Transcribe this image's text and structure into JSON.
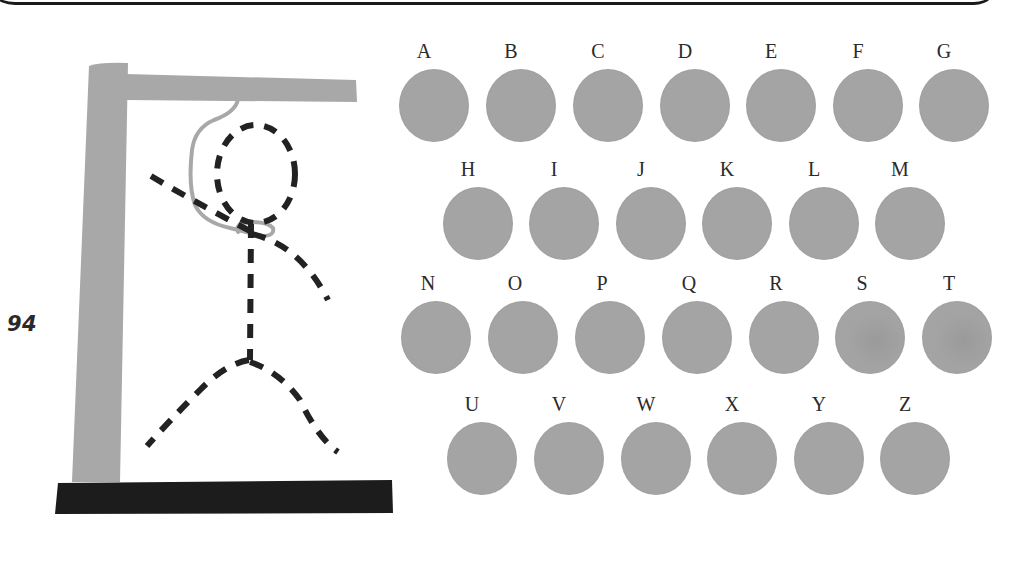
{
  "page": {
    "number": "94"
  },
  "game": {
    "type": "hangman",
    "colors": {
      "gallows_post": "#a8a8a8",
      "base": "#1c1c1c",
      "rope": "#a8a8a8",
      "figure_dashes": "#222222",
      "letter_circle": "#a4a4a4",
      "letter_text": "#2b2b2b"
    },
    "figure": {
      "style": "dashed",
      "parts": [
        "head",
        "body",
        "left-arm",
        "right-arm",
        "left-leg",
        "right-leg"
      ]
    },
    "letters": {
      "row1": [
        {
          "label": "A"
        },
        {
          "label": "B"
        },
        {
          "label": "C"
        },
        {
          "label": "D"
        },
        {
          "label": "E"
        },
        {
          "label": "F"
        },
        {
          "label": "G"
        }
      ],
      "row2": [
        {
          "label": "H"
        },
        {
          "label": "I"
        },
        {
          "label": "J"
        },
        {
          "label": "K"
        },
        {
          "label": "L"
        },
        {
          "label": "M"
        }
      ],
      "row3": [
        {
          "label": "N"
        },
        {
          "label": "O"
        },
        {
          "label": "P"
        },
        {
          "label": "Q"
        },
        {
          "label": "R"
        },
        {
          "label": "S"
        },
        {
          "label": "T"
        }
      ],
      "row4": [
        {
          "label": "U"
        },
        {
          "label": "V"
        },
        {
          "label": "W"
        },
        {
          "label": "X"
        },
        {
          "label": "Y"
        },
        {
          "label": "Z"
        }
      ]
    }
  }
}
